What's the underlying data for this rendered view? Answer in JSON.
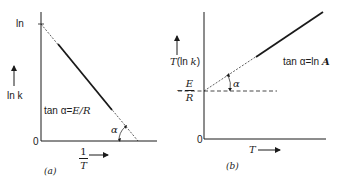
{
  "panel_a": {
    "caption": "(a)",
    "y_axis_label": "ln k",
    "y_intercept_label": "ln A",
    "origin_label": "0",
    "x_axis_label_num": "1",
    "x_axis_label_den": "T",
    "slope_annotation_prefix": "tan α=",
    "slope_annotation_value": "E/R",
    "angle_label": "α"
  },
  "panel_b": {
    "caption": "(b)",
    "y_axis_label": "T(ln k)",
    "y_intercept_sign": "−",
    "y_intercept_num": "E",
    "y_intercept_den": "R",
    "origin_label": "0",
    "x_axis_label": "T",
    "slope_annotation_prefix": "tan α=ln ",
    "slope_annotation_value": "A",
    "angle_label": "α"
  },
  "colors": {
    "ink": "#1a1a1a",
    "background": "#ffffff"
  }
}
